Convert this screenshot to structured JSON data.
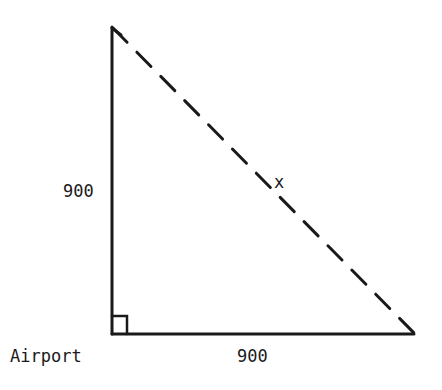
{
  "diagram": {
    "type": "right-triangle",
    "labels": {
      "vertical_side": "900",
      "horizontal_side": "900",
      "hypotenuse": "x",
      "vertex": "Airport"
    },
    "colors": {
      "ink": "#1a1a1a",
      "background": "#ffffff"
    }
  }
}
